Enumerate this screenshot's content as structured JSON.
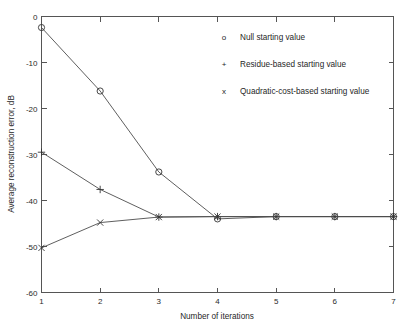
{
  "chart_data": {
    "type": "line",
    "title": "",
    "xlabel": "Number of iterations",
    "ylabel": "Average reconstruction error, dB",
    "x": [
      1,
      2,
      3,
      4,
      5,
      6,
      7
    ],
    "xlim": [
      1,
      7
    ],
    "ylim": [
      -60,
      0
    ],
    "xticks": [
      1,
      2,
      3,
      4,
      5,
      6,
      7
    ],
    "yticks": [
      0,
      -10,
      -20,
      -30,
      -40,
      -50,
      -60
    ],
    "xtick_labels": [
      "1",
      "2",
      "3",
      "4",
      "5",
      "6",
      "7"
    ],
    "ytick_labels": [
      "0",
      "-10",
      "-20",
      "-30",
      "-40",
      "-50",
      "-60"
    ],
    "grid": false,
    "legend_position": "upper right inside",
    "series": [
      {
        "name": "Null starting value",
        "marker": "o",
        "values": [
          -2.4,
          -16.2,
          -33.8,
          -44.0,
          -43.5,
          -43.5,
          -43.5
        ]
      },
      {
        "name": "Residue-based starting value",
        "marker": "+",
        "values": [
          -29.5,
          -37.6,
          -43.6,
          -43.5,
          -43.5,
          -43.5,
          -43.5
        ]
      },
      {
        "name": "Quadratic-cost-based starting value",
        "marker": "x",
        "values": [
          -50.3,
          -44.8,
          -43.6,
          -43.5,
          -43.5,
          -43.5,
          -43.5
        ]
      }
    ]
  },
  "legend": {
    "entries": [
      {
        "symbol": "o",
        "label": "Null starting value"
      },
      {
        "symbol": "+",
        "label": "Residue-based starting value"
      },
      {
        "symbol": "x",
        "label": "Quadratic-cost-based starting value"
      }
    ]
  },
  "colors": {
    "line": "#4d4d4d",
    "axis": "#555555",
    "text": "#1f1f1f",
    "background": "#ffffff"
  }
}
